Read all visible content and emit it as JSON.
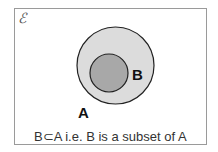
{
  "diagram": {
    "type": "venn",
    "universal_set_symbol": "ℰ",
    "sets": [
      {
        "name": "A",
        "label": "A",
        "fill": "#dcdcdc",
        "stroke": "#222222",
        "cx": 115.5,
        "cy": 65.5,
        "r": 38.5
      },
      {
        "name": "B",
        "label": "B",
        "fill": "#a8a8a8",
        "stroke": "#222222",
        "cx": 109,
        "cy": 73,
        "r": 19
      }
    ],
    "caption": "B⊂A  i.e. B is a subset of A"
  }
}
